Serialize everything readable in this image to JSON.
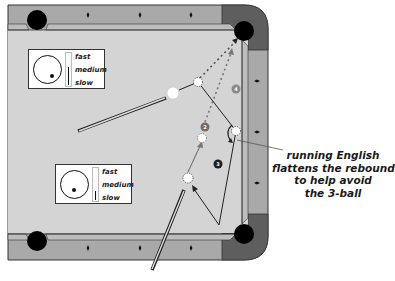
{
  "diagram": {
    "colors": {
      "felt": "#d4d4d4",
      "rail": "#a9a9a9",
      "rail_dark": "#5e5e5e",
      "cushion": "#bdbdbd",
      "pocket": "#000000",
      "cue_ball": "#ffffff",
      "object_ball_gray": "#7a7a7a",
      "object_ball_black": "#1e1e1e",
      "line": "#222222",
      "dotted_path": "#777777"
    },
    "balls": [
      {
        "id": "cue",
        "label": ""
      },
      {
        "id": "2",
        "label": "2"
      },
      {
        "id": "3",
        "label": "3"
      },
      {
        "id": "4",
        "label": "4"
      }
    ],
    "speed_indicators": [
      {
        "name": "shot-1",
        "labels": {
          "fast": "fast",
          "medium": "medium",
          "slow": "slow"
        },
        "selected_speed": "medium",
        "spin": "low right"
      },
      {
        "name": "shot-2",
        "labels": {
          "fast": "fast",
          "medium": "medium",
          "slow": "slow"
        },
        "selected_speed": "slow",
        "spin": "low left"
      }
    ],
    "annotation": {
      "lines": [
        "running English",
        "flattens the rebound",
        "to help avoid",
        "the 3-ball"
      ]
    }
  }
}
